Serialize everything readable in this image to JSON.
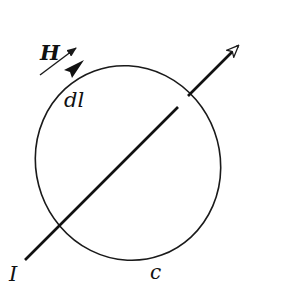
{
  "diagram": {
    "labels": {
      "field": "H",
      "element": "dl",
      "current": "I",
      "contour": "c"
    },
    "colors": {
      "stroke": "#1a1a1a",
      "background": "#ffffff"
    },
    "elements": [
      {
        "id": "contour-loop",
        "shape": "ellipse",
        "cx": 128,
        "cy": 163,
        "rx": 92,
        "ry": 98,
        "rotation": -20
      },
      {
        "id": "current-wire",
        "from": [
          25,
          260
        ],
        "to": [
          239,
          45
        ],
        "arrowhead": "hollow",
        "break_behind_loop": true
      },
      {
        "id": "field-arrow",
        "from": [
          40,
          75
        ],
        "to": [
          76,
          48
        ],
        "arrowhead": "filled-small"
      },
      {
        "id": "dl-arrow",
        "on": "contour-loop",
        "at": [
          78,
          66
        ],
        "arrowhead": "filled-large"
      }
    ]
  }
}
